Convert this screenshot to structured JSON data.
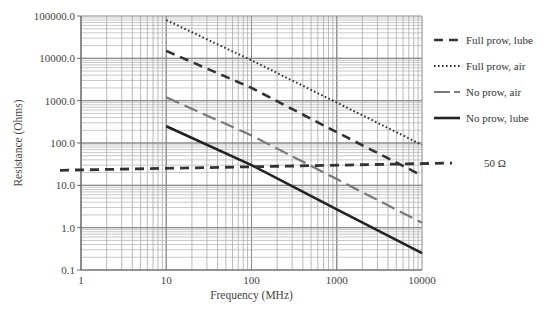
{
  "chart_data": {
    "type": "line",
    "title": "",
    "xlabel": "Frequency (MHz)",
    "ylabel": "Resistance (Ohms)",
    "xscale": "log",
    "yscale": "log",
    "xlim": [
      1,
      10000
    ],
    "ylim": [
      0.1,
      100000
    ],
    "xticks": [
      "1",
      "10",
      "100",
      "1000",
      "10000"
    ],
    "yticks": [
      "0.1",
      "1.0",
      "10.0",
      "100.0",
      "1000.0",
      "10000.0",
      "100000.0"
    ],
    "grid": true,
    "legend_position": "right",
    "series": [
      {
        "name": "Full prow, lube",
        "style": "dashed",
        "color": "#333333",
        "x": [
          10,
          100,
          1000,
          10000
        ],
        "values": [
          15000,
          2000,
          180,
          17
        ]
      },
      {
        "name": "Full prow, air",
        "style": "dotted",
        "color": "#333333",
        "x": [
          10,
          100,
          1000,
          10000
        ],
        "values": [
          80000,
          9000,
          900,
          90
        ]
      },
      {
        "name": "No prow, air",
        "style": "long-dash-gray",
        "color": "#777777",
        "x": [
          10,
          100,
          1000,
          10000
        ],
        "values": [
          1200,
          150,
          14,
          1.3
        ]
      },
      {
        "name": "No prow, lube",
        "style": "solid",
        "color": "#222222",
        "x": [
          10,
          100,
          1000,
          10000
        ],
        "values": [
          250,
          30,
          2.7,
          0.25
        ]
      }
    ],
    "annotations": [
      {
        "label": "50 Ω",
        "style": "dashed-thick",
        "x": [
          0.85,
          14000
        ],
        "values": [
          23,
          33
        ]
      }
    ]
  },
  "legend": {
    "items": [
      "Full prow, lube",
      "Full prow, air",
      "No prow, air",
      "No prow, lube"
    ],
    "reference_label": "50 Ω"
  }
}
